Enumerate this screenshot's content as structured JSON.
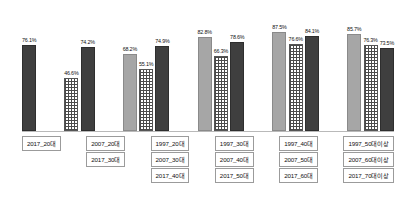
{
  "chart_data": {
    "type": "bar",
    "title": "",
    "subtitle": "",
    "xlabel": "",
    "ylabel": "",
    "ylim": [
      0,
      100
    ],
    "grid": false,
    "legend_position": "below-grouped",
    "value_suffix": "%",
    "series": [
      {
        "name": "1997",
        "style": "light-gray-solid",
        "color": "#a6a6a6"
      },
      {
        "name": "2007",
        "style": "checkered-grid",
        "color": "#4a4a4a"
      },
      {
        "name": "2017",
        "style": "dark-solid",
        "color": "#3f3f3f"
      }
    ],
    "groups": [
      {
        "bars": [
          {
            "series": "2017",
            "label": "2017_20대",
            "value": "76.1%",
            "number": 76.1
          }
        ]
      },
      {
        "bars": [
          {
            "series": "2007",
            "label": "2007_20대",
            "value": "46.6%",
            "number": 46.6
          },
          {
            "series": "2017",
            "label": "2017_30대",
            "value": "74.2%",
            "number": 74.2
          }
        ]
      },
      {
        "bars": [
          {
            "series": "1997",
            "label": "1997_20대",
            "value": "68.2%",
            "number": 68.2
          },
          {
            "series": "2007",
            "label": "2007_30대",
            "value": "55.1%",
            "number": 55.1
          },
          {
            "series": "2017",
            "label": "2017_40대",
            "value": "74.9%",
            "number": 74.9
          }
        ]
      },
      {
        "bars": [
          {
            "series": "1997",
            "label": "1997_30대",
            "value": "82.8%",
            "number": 82.8
          },
          {
            "series": "2007",
            "label": "2007_40대",
            "value": "66.3%",
            "number": 66.3
          },
          {
            "series": "2017",
            "label": "2017_50대",
            "value": "78.6%",
            "number": 78.6
          }
        ]
      },
      {
        "bars": [
          {
            "series": "1997",
            "label": "1997_40대",
            "value": "87.5%",
            "number": 87.5
          },
          {
            "series": "2007",
            "label": "2007_50대",
            "value": "76.6%",
            "number": 76.6
          },
          {
            "series": "2017",
            "label": "2017_60대",
            "value": "84.1%",
            "number": 84.1
          }
        ]
      },
      {
        "bars": [
          {
            "series": "1997",
            "label": "1997_50대이상",
            "value": "85.7%",
            "number": 85.7
          },
          {
            "series": "2007",
            "label": "2007_60대이상",
            "value": "76.3%",
            "number": 76.3
          },
          {
            "series": "2017",
            "label": "2017_70대이상",
            "value": "73.5%",
            "number": 73.5
          }
        ]
      }
    ]
  }
}
